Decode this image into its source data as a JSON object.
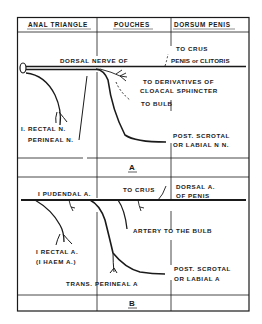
{
  "figure": {
    "columns": [
      "ANAL TRIANGLE",
      "POUCHES",
      "DORSUM PENIS"
    ],
    "panel_a": {
      "label": "A",
      "main_nerve": "DORSAL NERVE OF",
      "labels": {
        "to_crus": "TO CRUS",
        "penis_or_clitoris": "PENIS or CLITORIS",
        "derivatives_line1": "TO DERIVATIVES OF",
        "derivatives_line2": "CLOACAL SPHINCTER",
        "to_bulb": "TO BULB",
        "rectal_n": "I. RECTAL N.",
        "perineal_n": "PERINEAL N.",
        "scrotal_line1": "POST. SCROTAL",
        "scrotal_line2": "OR LABIAL N N."
      }
    },
    "panel_b": {
      "label": "B",
      "labels": {
        "pudendal_a": "I PUDENDAL A.",
        "to_crus": "TO CRUS",
        "dorsal_a_line1": "DORSAL A.",
        "dorsal_a_line2": "OF PENIS",
        "artery_bulb": "ARTERY TO THE BULB",
        "rectal_a_line1": "I RECTAL A.",
        "rectal_a_line2": "(I HAEM A.)",
        "trans_perineal": "TRANS. PERINEAL A",
        "scrotal_line1": "POST. SCROTAL",
        "scrotal_line2": "OR LABIAL A"
      }
    }
  }
}
